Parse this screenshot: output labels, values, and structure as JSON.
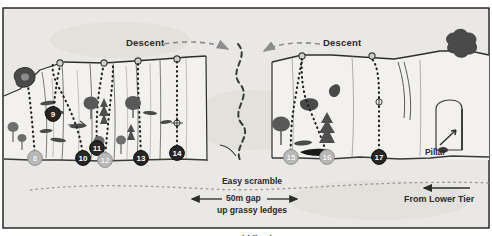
{
  "diagram": {
    "colors": {
      "paper": "#e9e8e4",
      "border": "#1d1d1d",
      "crag_face": "#f2f1ee",
      "ink": "#2b2b2b",
      "rock_dark": "#4a4a4a",
      "foliage_dark": "#595959",
      "foliage_mid": "#6e6e6e",
      "marker_dark": "#262626",
      "marker_light": "#b9b9b9",
      "ground": "#3a3a3a"
    }
  },
  "labels": {
    "descent_left": "Descent",
    "descent_right": "Descent",
    "scramble_line1": "Easy scramble",
    "scramble_line2": "up grassy ledges",
    "scramble_line3": "to middle Tier",
    "gap": "50m gap",
    "pillar": "Pillar",
    "from_lower_tier": "From Lower Tier"
  },
  "route_markers": [
    {
      "id": "8",
      "label": "8",
      "x": 35,
      "y": 158,
      "style": "light"
    },
    {
      "id": "9",
      "label": "9",
      "x": 53,
      "y": 114,
      "style": "dark"
    },
    {
      "id": "10",
      "label": "10",
      "x": 83,
      "y": 158,
      "style": "dark"
    },
    {
      "id": "11",
      "label": "11",
      "x": 97,
      "y": 148,
      "style": "dark"
    },
    {
      "id": "12",
      "label": "12",
      "x": 105,
      "y": 160,
      "style": "light"
    },
    {
      "id": "13",
      "label": "13",
      "x": 141,
      "y": 158,
      "style": "dark"
    },
    {
      "id": "14",
      "label": "14",
      "x": 177,
      "y": 153,
      "style": "dark"
    },
    {
      "id": "15",
      "label": "15",
      "x": 291,
      "y": 157,
      "style": "light"
    },
    {
      "id": "16",
      "label": "16",
      "x": 327,
      "y": 157,
      "style": "light"
    },
    {
      "id": "17",
      "label": "17",
      "x": 379,
      "y": 157,
      "style": "dark"
    }
  ]
}
